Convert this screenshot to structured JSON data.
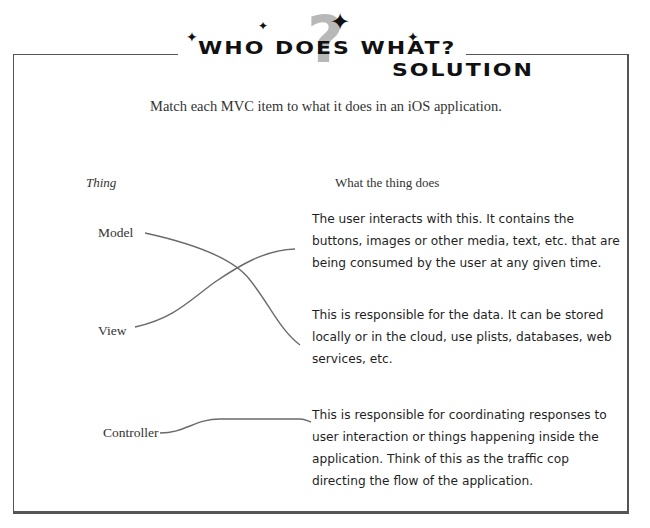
{
  "header": {
    "title": "Who does what?",
    "subtitle": "Solution",
    "decoration": [
      "question-mark-icon",
      "sparkle-star-icon"
    ]
  },
  "instructions": "Match each MVC item to what it does in an iOS application.",
  "columns": {
    "left_heading": "Thing",
    "right_heading": "What the thing does"
  },
  "things": [
    {
      "label": "Model"
    },
    {
      "label": "View"
    },
    {
      "label": "Controller"
    }
  ],
  "descriptions": [
    {
      "text": "The user interacts with this. It contains the buttons, images or other media, text, etc. that are being consumed by the user at any given time."
    },
    {
      "text": "This is responsible for the data. It can be stored locally or in the cloud, use plists, databases, web services, etc."
    },
    {
      "text": "This is responsible for coordinating responses to user interaction or things happening inside the application. Think of this as the traffic cop directing the flow of the application."
    }
  ],
  "matches": [
    {
      "thing": "Model",
      "description_index": 1
    },
    {
      "thing": "View",
      "description_index": 0
    },
    {
      "thing": "Controller",
      "description_index": 2
    }
  ],
  "colors": {
    "line": "#666666",
    "border": "#555555",
    "question_mark": "#b8b8b8"
  }
}
